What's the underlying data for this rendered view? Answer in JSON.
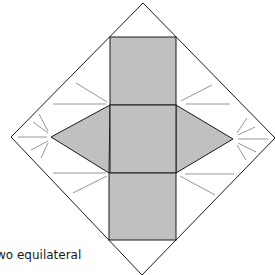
{
  "diagram": {
    "colors": {
      "fill": "#c0c0c0",
      "outline": "#1a1a1a",
      "fold_lines": "#8a8a8a",
      "background": "#ffffff"
    },
    "outer_diamond": {
      "top": [
        143,
        3
      ],
      "right": [
        275,
        138
      ],
      "bottom": [
        142,
        275
      ],
      "left": [
        11,
        137
      ]
    },
    "rectangles": [
      {
        "name": "top-rectangle",
        "x": 110,
        "y": 37,
        "w": 66,
        "h": 68
      },
      {
        "name": "middle-square",
        "x": 110,
        "y": 105,
        "w": 66,
        "h": 68
      },
      {
        "name": "bottom-rectangle",
        "x": 109,
        "y": 173,
        "w": 67,
        "h": 67
      }
    ],
    "triangles": [
      {
        "name": "left-triangle",
        "points": [
          [
            110,
            105
          ],
          [
            51,
            137
          ],
          [
            109,
            173
          ]
        ]
      },
      {
        "name": "right-triangle",
        "points": [
          [
            176,
            105
          ],
          [
            233,
            139
          ],
          [
            176,
            173
          ]
        ]
      }
    ]
  },
  "caption": "wo equilateral"
}
